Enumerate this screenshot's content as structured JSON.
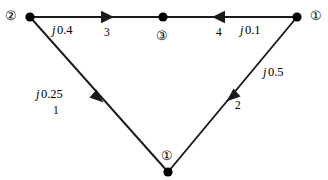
{
  "diagram": {
    "background_color": "#ffffff",
    "line_color": "#1a1a1a",
    "text_color": "#000000"
  },
  "nodes": [
    {
      "id": "n2",
      "tag": "②",
      "name": "node-2",
      "x": 30,
      "y": 17
    },
    {
      "id": "n3",
      "tag": "③",
      "name": "node-3",
      "x": 163,
      "y": 17
    },
    {
      "id": "n1r",
      "tag": "①",
      "name": "node-1-right",
      "x": 297,
      "y": 17
    },
    {
      "id": "n1b",
      "tag": "①",
      "name": "node-1-bottom",
      "x": 168,
      "y": 172
    }
  ],
  "branches": [
    {
      "number": "1",
      "impedance_prefix": "j",
      "impedance_value": "0.25",
      "from": "n1b",
      "to": "n2",
      "direction": "up-left"
    },
    {
      "number": "2",
      "impedance_prefix": "j",
      "impedance_value": "0.5",
      "from": "n1b",
      "to": "n1r",
      "direction": "up-right"
    },
    {
      "number": "3",
      "impedance_prefix": "j",
      "impedance_value": "0.4",
      "from": "n2",
      "to": "n3",
      "direction": "right"
    },
    {
      "number": "4",
      "impedance_prefix": "j",
      "impedance_value": "0.1",
      "from": "n1r",
      "to": "n3",
      "direction": "left"
    }
  ],
  "labels": {
    "imp_1": {
      "prefix": "j",
      "value": "0.25",
      "x": 36,
      "y": 88
    },
    "imp_2": {
      "prefix": "j",
      "value": "0.5",
      "x": 263,
      "y": 66
    },
    "imp_3": {
      "prefix": "j",
      "value": "0.4",
      "x": 52,
      "y": 24
    },
    "imp_4": {
      "prefix": "j",
      "value": "0.1",
      "x": 240,
      "y": 24
    },
    "num_1": {
      "text": "1",
      "x": 53,
      "y": 105
    },
    "num_2": {
      "text": "2",
      "x": 235,
      "y": 100
    },
    "num_3": {
      "text": "3",
      "x": 104,
      "y": 27
    },
    "num_4": {
      "text": "4",
      "x": 216,
      "y": 27
    },
    "tag_2": {
      "text": "②",
      "x": 5,
      "y": 10
    },
    "tag_3": {
      "text": "③",
      "x": 156,
      "y": 30
    },
    "tag_1r": {
      "text": "①",
      "x": 310,
      "y": 10
    },
    "tag_1b": {
      "text": "①",
      "x": 161,
      "y": 150
    }
  }
}
